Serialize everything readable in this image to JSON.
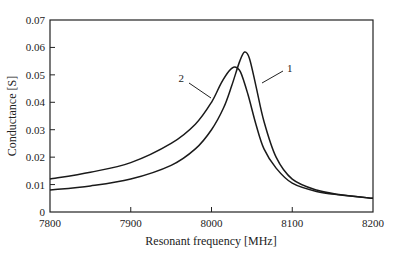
{
  "chart_data": {
    "type": "line",
    "title": "",
    "xlabel": "Resonant frequency [MHz]",
    "ylabel": "Conductance [S]",
    "xlim": [
      7800,
      8200
    ],
    "ylim": [
      0,
      0.07
    ],
    "grid": false,
    "legend_position": "inline labels",
    "x_ticks": [
      "7800",
      "7900",
      "8000",
      "8100",
      "8200"
    ],
    "y_ticks": [
      "0",
      "0.01",
      "0.02",
      "0.03",
      "0.04",
      "0.05",
      "0.06",
      "0.07"
    ],
    "series": [
      {
        "name": "1",
        "x": [
          7800,
          7850,
          7900,
          7950,
          7980,
          8000,
          8015,
          8025,
          8035,
          8041,
          8047,
          8055,
          8065,
          8080,
          8100,
          8130,
          8160,
          8200
        ],
        "y": [
          0.008,
          0.0095,
          0.012,
          0.017,
          0.023,
          0.03,
          0.038,
          0.046,
          0.055,
          0.0583,
          0.056,
          0.046,
          0.033,
          0.02,
          0.012,
          0.008,
          0.0063,
          0.005
        ]
      },
      {
        "name": "2",
        "x": [
          7800,
          7850,
          7900,
          7950,
          7980,
          8000,
          8012,
          8022,
          8029,
          8036,
          8045,
          8055,
          8065,
          8080,
          8100,
          8130,
          8160,
          8200
        ],
        "y": [
          0.012,
          0.0145,
          0.018,
          0.025,
          0.032,
          0.04,
          0.047,
          0.0515,
          0.0529,
          0.051,
          0.043,
          0.032,
          0.023,
          0.016,
          0.0105,
          0.0075,
          0.0062,
          0.005
        ]
      }
    ],
    "annotations": [
      {
        "text": "1",
        "x": 8075,
        "y": 0.0525
      },
      {
        "text": "2",
        "x": 7962,
        "y": 0.0485
      }
    ]
  }
}
